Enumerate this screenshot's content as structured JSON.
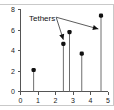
{
  "chart_data": {
    "type": "scatter",
    "title": "",
    "xlabel": "",
    "ylabel": "",
    "xlim": [
      0,
      5
    ],
    "ylim": [
      0,
      8
    ],
    "xticks": [
      "0",
      "1",
      "2",
      "3",
      "4",
      "5"
    ],
    "yticks": [
      "0",
      "2",
      "4",
      "6",
      "8"
    ],
    "grid": false,
    "legend": "none",
    "marker_style": "stem-with-filled-circle",
    "points": [
      {
        "x": 0.75,
        "y": 2.1
      },
      {
        "x": 2.45,
        "y": 4.65
      },
      {
        "x": 2.8,
        "y": 5.8
      },
      {
        "x": 3.5,
        "y": 3.7
      },
      {
        "x": 4.6,
        "y": 7.4
      }
    ],
    "annotations": [
      {
        "text": "Tethers",
        "text_x": 0.55,
        "text_y": 7.25,
        "targets": [
          {
            "x": 2.45,
            "y": 5.05
          },
          {
            "x": 4.45,
            "y": 6.1
          }
        ]
      }
    ]
  },
  "axes": {
    "x_axis_name": "x-axis",
    "y_axis_name": "y-axis"
  },
  "colors": {
    "marker": "#111111",
    "stem": "#6e6e6e",
    "axis": "#555555",
    "frame": "#c9c9c9",
    "background": "#ffffff",
    "annotation": "#4a4a4a"
  }
}
